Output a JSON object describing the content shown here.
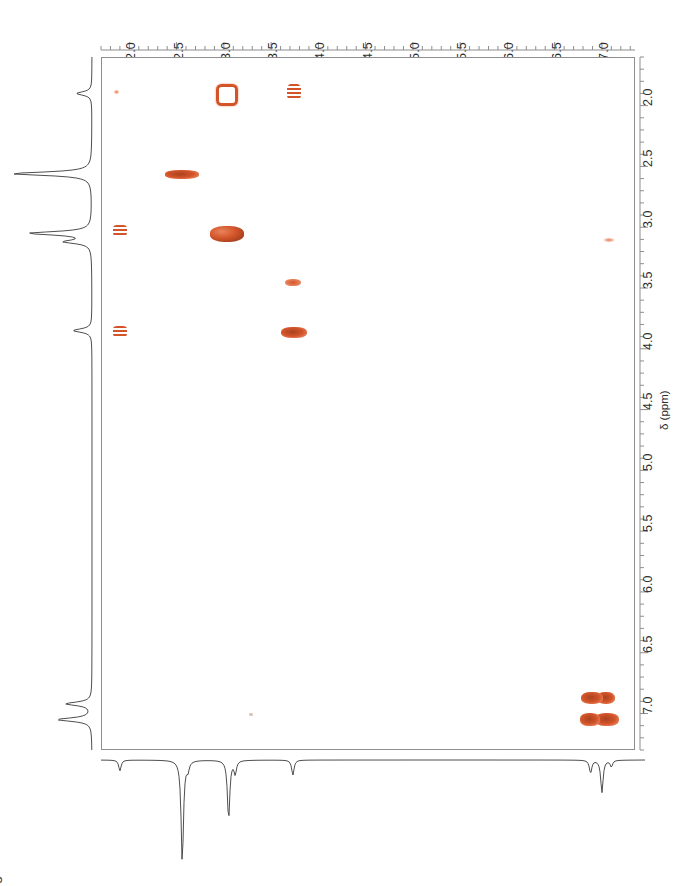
{
  "title": "gCOSY",
  "experiment_label": "gCOSY",
  "header_ghost": "",
  "colors": {
    "peak": "#d4542a",
    "peak_light": "#e8835c",
    "peak_dark": "#a8431f",
    "axis": "#8e8e8e",
    "trace": "#3a3a3a",
    "text": "#2e2e2e"
  },
  "axes": {
    "f2": {
      "name": "F2",
      "orientation": "horizontal-top",
      "unit": "ppm",
      "direction": "reversed",
      "min": 1.7,
      "max": 7.35,
      "tick_labels": [
        "2.0",
        "2.5",
        "3.0",
        "3.5",
        "4.0",
        "4.5",
        "5.0",
        "5.5",
        "6.0",
        "6.5",
        "7.0"
      ],
      "tick_values": [
        2.0,
        2.5,
        3.0,
        3.5,
        4.0,
        4.5,
        5.0,
        5.5,
        6.0,
        6.5,
        7.0
      ]
    },
    "f1": {
      "name": "F1",
      "orientation": "vertical-right",
      "unit": "ppm",
      "label": "δ (ppm)",
      "direction": "reversed",
      "min": 1.6,
      "max": 7.3,
      "tick_labels": [
        "2.0",
        "2.5",
        "3.0",
        "3.5",
        "4.0",
        "4.5",
        "5.0",
        "5.5",
        "6.0",
        "6.5",
        "7.0"
      ],
      "tick_values": [
        2.0,
        2.5,
        3.0,
        3.5,
        4.0,
        4.5,
        5.0,
        5.5,
        6.0,
        6.5,
        7.0
      ]
    }
  },
  "chart_data": {
    "type": "scatter",
    "title": "gCOSY",
    "xlabel": "",
    "ylabel": "δ (ppm)",
    "xlim": [
      7.35,
      1.7
    ],
    "ylim": [
      7.3,
      1.6
    ],
    "grid": false,
    "legend": "none",
    "peaks": [
      {
        "label": "cross-peak-1",
        "f2": 1.85,
        "f1": 1.88,
        "w": 5,
        "h": 4,
        "intensity": "weak"
      },
      {
        "label": "cross-peak-2",
        "f2": 2.99,
        "f1": 1.88,
        "w": 16,
        "h": 16,
        "intensity": "medium",
        "shape": "ring"
      },
      {
        "label": "cross-peak-3",
        "f2": 3.73,
        "f1": 1.88,
        "w": 14,
        "h": 16,
        "intensity": "medium",
        "shape": "striped"
      },
      {
        "label": "diagonal-peak-2.55",
        "f2": 2.55,
        "f1": 2.56,
        "w": 34,
        "h": 9,
        "intensity": "strong"
      },
      {
        "label": "cross-peak-4",
        "f2": 1.89,
        "f1": 3.02,
        "w": 14,
        "h": 11,
        "intensity": "medium",
        "shape": "striped"
      },
      {
        "label": "diagonal-peak-3.05",
        "f2": 3.02,
        "f1": 3.05,
        "w": 34,
        "h": 16,
        "intensity": "strong",
        "shape": "cluster"
      },
      {
        "label": "cross-peak-5",
        "f2": 7.06,
        "f1": 3.1,
        "w": 10,
        "h": 4,
        "intensity": "weak"
      },
      {
        "label": "cross-peak-6",
        "f2": 3.72,
        "f1": 3.45,
        "w": 16,
        "h": 7,
        "intensity": "medium"
      },
      {
        "label": "cross-peak-7",
        "f2": 1.89,
        "f1": 3.85,
        "w": 14,
        "h": 11,
        "intensity": "medium",
        "shape": "striped"
      },
      {
        "label": "cross-peak-8",
        "f2": 3.73,
        "f1": 3.86,
        "w": 26,
        "h": 11,
        "intensity": "strong"
      },
      {
        "label": "aromatic-peak-a",
        "f2": 7.03,
        "f1": 6.86,
        "w": 18,
        "h": 12,
        "intensity": "strong"
      },
      {
        "label": "aromatic-peak-b",
        "f2": 6.88,
        "f1": 6.86,
        "w": 22,
        "h": 12,
        "intensity": "strong"
      },
      {
        "label": "aromatic-peak-c",
        "f2": 7.04,
        "f1": 7.04,
        "w": 24,
        "h": 13,
        "intensity": "strong"
      },
      {
        "label": "aromatic-peak-d",
        "f2": 6.86,
        "f1": 7.04,
        "w": 20,
        "h": 13,
        "intensity": "strong"
      },
      {
        "label": "trace-artifact",
        "f2": 3.28,
        "f1": 7.0,
        "w": 4,
        "h": 3,
        "intensity": "very-weak"
      }
    ],
    "projection_f1_peaks": [
      {
        "ppm": 1.9,
        "height": 0.18
      },
      {
        "ppm": 2.56,
        "height": 0.92
      },
      {
        "ppm": 3.05,
        "height": 0.72
      },
      {
        "ppm": 3.12,
        "height": 0.3
      },
      {
        "ppm": 3.85,
        "height": 0.22
      },
      {
        "ppm": 6.92,
        "height": 0.3
      },
      {
        "ppm": 7.05,
        "height": 0.4
      }
    ],
    "projection_f2_peaks": [
      {
        "ppm": 1.9,
        "height": 0.1
      },
      {
        "ppm": 2.56,
        "height": 0.95
      },
      {
        "ppm": 2.62,
        "height": 0.08
      },
      {
        "ppm": 3.05,
        "height": 0.55
      },
      {
        "ppm": 3.12,
        "height": 0.12
      },
      {
        "ppm": 3.73,
        "height": 0.14
      },
      {
        "ppm": 6.88,
        "height": 0.12
      },
      {
        "ppm": 7.0,
        "height": 0.3
      },
      {
        "ppm": 7.1,
        "height": 0.06
      }
    ]
  }
}
